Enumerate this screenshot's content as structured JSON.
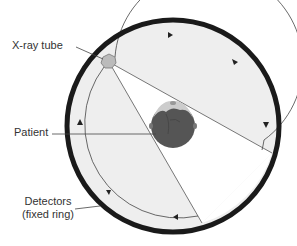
{
  "labels": {
    "xray_tube": "X-ray tube",
    "patient": "Patient",
    "detectors_line1": "Detectors",
    "detectors_line2": "(fixed ring)"
  },
  "colors": {
    "ring": "#1a1a1a",
    "gantry_fill": "#eeeeee",
    "beam_fill": "#ffffff",
    "head_dark": "#555555",
    "head_light": "#cccccc",
    "tube": "#bbbbbb",
    "line": "#444444"
  }
}
